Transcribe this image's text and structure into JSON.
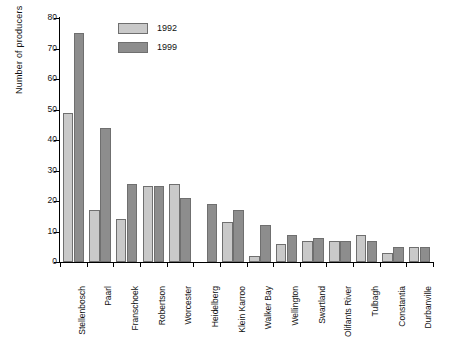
{
  "chart_data": {
    "type": "bar",
    "title": "",
    "xlabel": "",
    "ylabel": "Number of producers",
    "ylim": [
      0,
      80
    ],
    "yticks": [
      0,
      10,
      20,
      30,
      40,
      50,
      60,
      70,
      80
    ],
    "grid": false,
    "legend_position": "top-left-inside",
    "categories": [
      "Stellenbosch",
      "Paarl",
      "Franschoek",
      "Robertson",
      "Worcester",
      "Heidelberg",
      "Klein Karroo",
      "Walker Bay",
      "Wellington",
      "Swartland",
      "Olifants River",
      "Tulbagh",
      "Constantia",
      "Durbanville"
    ],
    "series": [
      {
        "name": "1992",
        "color": "#c9c9c9",
        "values": [
          49,
          17,
          14,
          25,
          25.5,
          0,
          13,
          2,
          6,
          7,
          7,
          9,
          3,
          5
        ]
      },
      {
        "name": "1999",
        "color": "#8d8d8d",
        "values": [
          75,
          44,
          25.5,
          25,
          21,
          19,
          17,
          12,
          9,
          8,
          7,
          7,
          5,
          5
        ]
      }
    ]
  },
  "colors": {
    "series_1992": "#c9c9c9",
    "series_1999": "#8d8d8d",
    "bar_outline": "#6f6f6f",
    "axis": "#000000",
    "background": "#ffffff"
  }
}
